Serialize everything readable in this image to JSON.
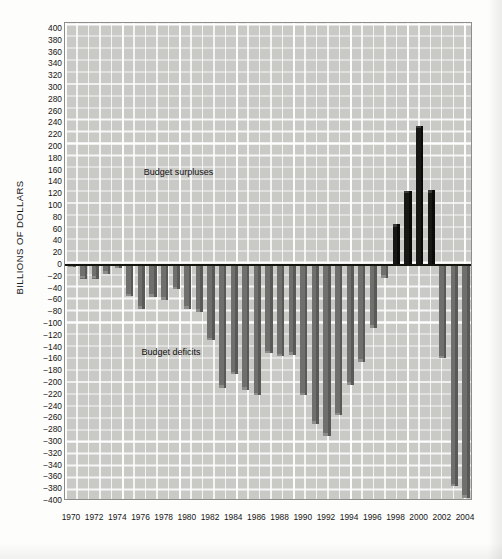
{
  "chart_data": {
    "type": "bar",
    "title": "",
    "xlabel": "",
    "ylabel": "BILLIONS OF DOLLARS",
    "ylim": [
      -400,
      410
    ],
    "xlim": [
      1969.4,
      2004.6
    ],
    "grid": true,
    "legend_position": "none",
    "y_ticks": [
      400,
      380,
      360,
      340,
      320,
      300,
      280,
      260,
      240,
      220,
      200,
      180,
      160,
      140,
      120,
      100,
      80,
      60,
      40,
      20,
      0,
      -20,
      -40,
      -60,
      -80,
      -100,
      -120,
      -140,
      -160,
      -180,
      -200,
      -220,
      -240,
      -260,
      -280,
      -300,
      -320,
      -340,
      -360,
      -380,
      -400
    ],
    "y_tick_labels": [
      "400",
      "380",
      "360",
      "340",
      "320",
      "300",
      "280",
      "260",
      "240",
      "220",
      "200",
      "180",
      "160",
      "140",
      "120",
      "100",
      "80",
      "60",
      "40",
      "20",
      "0",
      "−20",
      "−40",
      "−60",
      "−80",
      "−100",
      "−120",
      "−140",
      "−160",
      "−180",
      "−200",
      "−220",
      "−240",
      "−260",
      "−280",
      "−300",
      "−320",
      "−340",
      "−360",
      "−380",
      "−400"
    ],
    "x_tick_labels": [
      "1970",
      "1972",
      "1974",
      "1976",
      "1978",
      "1980",
      "1982",
      "1984",
      "1986",
      "1988",
      "1990",
      "1992",
      "1994",
      "1996",
      "1998",
      "2000",
      "2002",
      "2004"
    ],
    "categories": [
      1970,
      1971,
      1972,
      1973,
      1974,
      1975,
      1976,
      1977,
      1978,
      1979,
      1980,
      1981,
      1982,
      1983,
      1984,
      1985,
      1986,
      1987,
      1988,
      1989,
      1990,
      1991,
      1992,
      1993,
      1994,
      1995,
      1996,
      1997,
      1998,
      1999,
      2000,
      2001,
      2002,
      2003,
      2004
    ],
    "values": [
      -3,
      -23,
      -23,
      -15,
      -6,
      -53,
      -74,
      -54,
      -59,
      -41,
      -74,
      -79,
      -128,
      -208,
      -185,
      -212,
      -221,
      -150,
      -155,
      -152,
      -221,
      -269,
      -290,
      -255,
      -203,
      -164,
      -107,
      -22,
      69,
      126,
      236,
      127,
      -158,
      -375,
      -395
    ],
    "annotations": [
      {
        "text": "Budget surpluses",
        "x": 1976.2,
        "y": 155
      },
      {
        "text": "Budget deficits",
        "x": 1976.0,
        "y": -150
      }
    ],
    "colors": {
      "deficit_bar": "#6f6f6d",
      "surplus_bar": "#171714",
      "plot_background": "#c9c9c6",
      "gridline": "#ffffff",
      "zero_line": "#15150f",
      "text": "#161616"
    }
  }
}
